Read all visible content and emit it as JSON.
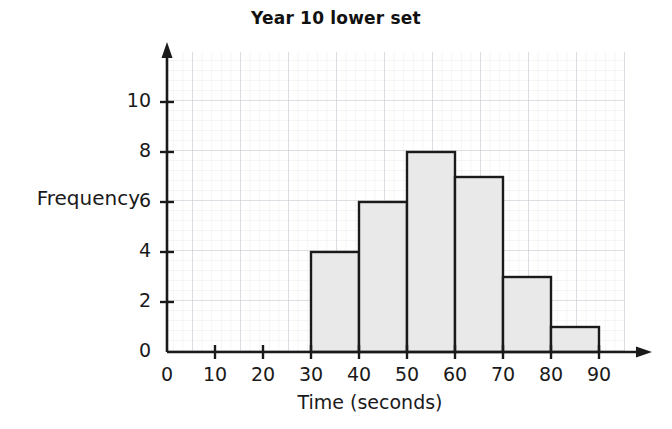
{
  "chart_data": {
    "type": "bar",
    "title": "Year 10 lower set",
    "xlabel": "Time (seconds)",
    "ylabel": "Frequency",
    "categories": [
      "30-40",
      "40-50",
      "50-60",
      "60-70",
      "70-80",
      "80-90"
    ],
    "bin_edges": [
      30,
      40,
      50,
      60,
      70,
      80,
      90
    ],
    "values": [
      4,
      6,
      8,
      7,
      3,
      1
    ],
    "xlim": [
      0,
      90
    ],
    "ylim": [
      0,
      11
    ],
    "x_ticks": [
      0,
      10,
      20,
      30,
      40,
      50,
      60,
      70,
      80,
      90
    ],
    "y_ticks": [
      0,
      2,
      4,
      6,
      8,
      10
    ],
    "grid": true,
    "grid_style": "graph-paper",
    "legend": null,
    "bar_fill_color": "#e9e9e9",
    "bar_stroke_color": "#1a1a1a",
    "axis_color": "#1a1a1a",
    "grid_minor_color": "#e3e3ea",
    "grid_major_color": "#c9c9d2"
  },
  "axes": {
    "y_tick_labels": [
      "0",
      "2",
      "4",
      "6",
      "8",
      "10"
    ],
    "x_tick_labels": [
      "0",
      "10",
      "20",
      "30",
      "40",
      "50",
      "60",
      "70",
      "80",
      "90"
    ]
  }
}
